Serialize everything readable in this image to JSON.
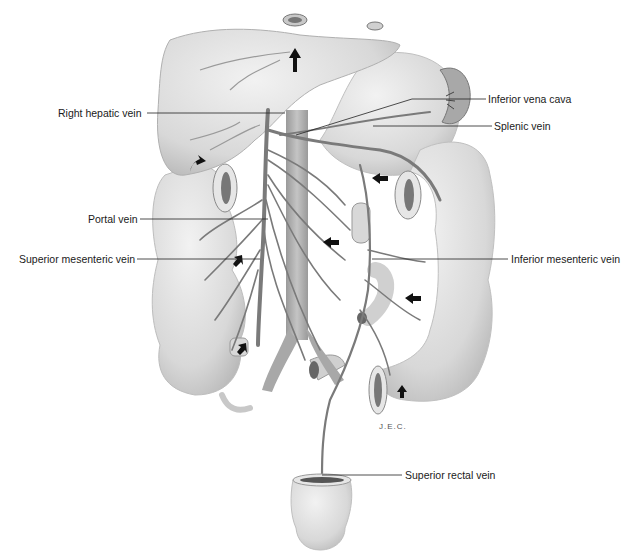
{
  "diagram": {
    "labels": {
      "right_hepatic_vein": "Right hepatic vein",
      "inferior_vena_cava": "Inferior vena cava",
      "splenic_vein": "Splenic vein",
      "portal_vein": "Portal vein",
      "superior_mesenteric_vein": "Superior mesenteric vein",
      "inferior_mesenteric_vein": "Inferior mesenteric vein",
      "superior_rectal_vein": "Superior rectal vein"
    },
    "signature": "J.E.C.",
    "colors": {
      "organ_fill": "#d9d9d9",
      "organ_shade": "#bdbdbd",
      "vein": "#7a7a7a",
      "arrow": "#111111",
      "leader_line": "#222222"
    }
  }
}
